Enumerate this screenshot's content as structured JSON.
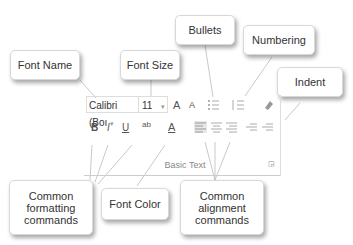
{
  "callouts": {
    "font_name": "Font Name",
    "font_size": "Font Size",
    "bullets": "Bullets",
    "numbering": "Numbering",
    "indent": "Indent",
    "common_formatting": "Common formatting commands",
    "font_color": "Font Color",
    "common_alignment": "Common alignment commands"
  },
  "ribbon": {
    "font_name_value": "Calibri (Boı",
    "font_size_value": "11",
    "grow_font": "A",
    "shrink_font": "A",
    "bold": "B",
    "italic": "I",
    "underline": "U",
    "highlight": "ab",
    "font_color": "A",
    "group_label": "Basic Text",
    "dropdown_glyph": "▾"
  }
}
